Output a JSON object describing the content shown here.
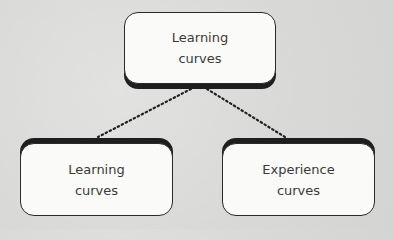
{
  "diagram": {
    "root": {
      "line1": "Learning",
      "line2": "curves"
    },
    "children": [
      {
        "line1": "Learning",
        "line2": "curves"
      },
      {
        "line1": "Experience",
        "line2": "curves"
      }
    ],
    "connector_style": "dotted",
    "colors": {
      "box_fill": "#fafaf8",
      "box_border": "#2a2a2a",
      "shadow": "#1e1e1e",
      "background": "#dcdcda",
      "text": "#3a3a3a"
    }
  }
}
